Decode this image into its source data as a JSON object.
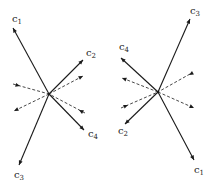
{
  "diagrams": [
    {
      "name": "left",
      "center": [
        49,
        94
      ],
      "vectors": [
        {
          "label": "c",
          "sub": "1",
          "tip": [
            13,
            28
          ],
          "label_pos": [
            12,
            22
          ]
        },
        {
          "label": "c",
          "sub": "2",
          "tip": [
            83,
            60
          ],
          "label_pos": [
            86,
            56
          ]
        },
        {
          "label": "c",
          "sub": "4",
          "tip": [
            84,
            130
          ],
          "label_pos": [
            88,
            137
          ]
        },
        {
          "label": "c",
          "sub": "3",
          "tip": [
            19,
            165
          ],
          "label_pos": [
            14,
            178
          ]
        }
      ],
      "dashed": [
        {
          "from": [
            13,
            84
          ],
          "to": [
            49,
            94
          ],
          "arrow_at": [
            20,
            86
          ],
          "arrow_dir": "inward"
        },
        {
          "from": [
            49,
            94
          ],
          "to": [
            14,
            111
          ],
          "arrow_at": [
            14,
            111
          ],
          "arrow_dir": "outward"
        },
        {
          "from": [
            49,
            94
          ],
          "to": [
            83,
            76
          ],
          "arrow_at": [
            83,
            76
          ],
          "arrow_dir": "outward"
        },
        {
          "from": [
            85,
            113
          ],
          "to": [
            49,
            94
          ],
          "arrow_at": [
            79,
            110
          ],
          "arrow_dir": "inward"
        }
      ]
    },
    {
      "name": "right",
      "center": [
        158,
        92
      ],
      "vectors": [
        {
          "label": "c",
          "sub": "3",
          "tip": [
            190,
            19
          ],
          "label_pos": [
            190,
            14
          ]
        },
        {
          "label": "c",
          "sub": "4",
          "tip": [
            121,
            58
          ],
          "label_pos": [
            119,
            50
          ]
        },
        {
          "label": "c",
          "sub": "2",
          "tip": [
            125,
            124
          ],
          "label_pos": [
            118,
            134
          ]
        },
        {
          "label": "c",
          "sub": "1",
          "tip": [
            194,
            160
          ],
          "label_pos": [
            194,
            173
          ]
        }
      ],
      "dashed": [
        {
          "from": [
            158,
            92
          ],
          "to": [
            122,
            78
          ],
          "arrow_at": [
            122,
            78
          ],
          "arrow_dir": "outward"
        },
        {
          "from": [
            121,
            108
          ],
          "to": [
            158,
            92
          ],
          "arrow_at": [
            128,
            105
          ],
          "arrow_dir": "inward"
        },
        {
          "from": [
            190,
            74
          ],
          "to": [
            158,
            92
          ],
          "arrow_at": [
            189,
            75
          ],
          "arrow_dir": "inward"
        },
        {
          "from": [
            158,
            92
          ],
          "to": [
            194,
            108
          ],
          "arrow_at": [
            194,
            108
          ],
          "arrow_dir": "outward"
        }
      ]
    }
  ]
}
